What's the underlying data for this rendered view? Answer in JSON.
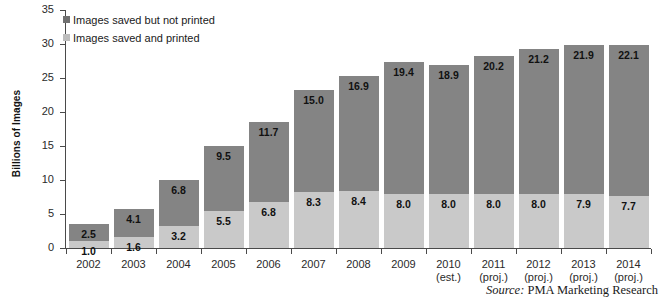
{
  "chart_data": {
    "type": "bar",
    "subtype": "stacked-bar",
    "title": "",
    "xlabel": "",
    "ylabel": "Billions of Images",
    "ylim": [
      0,
      35
    ],
    "y_ticks": [
      0,
      5,
      10,
      15,
      20,
      25,
      30,
      35
    ],
    "grid": false,
    "legend_position": "top-left",
    "categories": [
      "2002",
      "2003",
      "2004",
      "2005",
      "2006",
      "2007",
      "2008",
      "2009",
      "2010 (est.)",
      "2011 (proj.)",
      "2012 (proj.)",
      "2013 (proj.)",
      "2014 (proj.)"
    ],
    "category_labels": [
      {
        "year": "2002",
        "qualifier": ""
      },
      {
        "year": "2003",
        "qualifier": ""
      },
      {
        "year": "2004",
        "qualifier": ""
      },
      {
        "year": "2005",
        "qualifier": ""
      },
      {
        "year": "2006",
        "qualifier": ""
      },
      {
        "year": "2007",
        "qualifier": ""
      },
      {
        "year": "2008",
        "qualifier": ""
      },
      {
        "year": "2009",
        "qualifier": ""
      },
      {
        "year": "2010",
        "qualifier": "(est.)"
      },
      {
        "year": "2011",
        "qualifier": "(proj.)"
      },
      {
        "year": "2012",
        "qualifier": "(proj.)"
      },
      {
        "year": "2013",
        "qualifier": "(proj.)"
      },
      {
        "year": "2014",
        "qualifier": "(proj.)"
      }
    ],
    "series": [
      {
        "name": "Images saved and printed",
        "color": "#c9c9c9",
        "values": [
          1.0,
          1.6,
          3.2,
          5.5,
          6.8,
          8.3,
          8.4,
          8.0,
          8.0,
          8.0,
          8.0,
          7.9,
          7.7
        ],
        "labels": [
          "1.0",
          "1.6",
          "3.2",
          "5.5",
          "6.8",
          "8.3",
          "8.4",
          "8.0",
          "8.0",
          "8.0",
          "8.0",
          "7.9",
          "7.7"
        ]
      },
      {
        "name": "Images saved but not printed",
        "color": "#848484",
        "values": [
          2.5,
          4.1,
          6.8,
          9.5,
          11.7,
          15.0,
          16.9,
          19.4,
          18.9,
          20.2,
          21.2,
          21.9,
          22.1
        ],
        "labels": [
          "2.5",
          "4.1",
          "6.8",
          "9.5",
          "11.7",
          "15.0",
          "16.9",
          "19.4",
          "18.9",
          "20.2",
          "21.2",
          "21.9",
          "22.1"
        ]
      }
    ],
    "totals": [
      3.5,
      5.7,
      10.0,
      15.0,
      18.5,
      23.3,
      25.3,
      27.4,
      26.9,
      28.2,
      29.2,
      29.8,
      29.8
    ]
  },
  "legend": {
    "items": [
      {
        "label": "Images saved but not printed",
        "swatch": "dark"
      },
      {
        "label": "Images saved and printed",
        "swatch": "light"
      }
    ]
  },
  "source": {
    "prefix": "Source:",
    "text": "PMA Marketing Research"
  },
  "colors": {
    "series_dark": "#848484",
    "series_light": "#c9c9c9",
    "axis": "#4a4a4a",
    "text": "#1a1a1a",
    "background": "#ffffff"
  }
}
